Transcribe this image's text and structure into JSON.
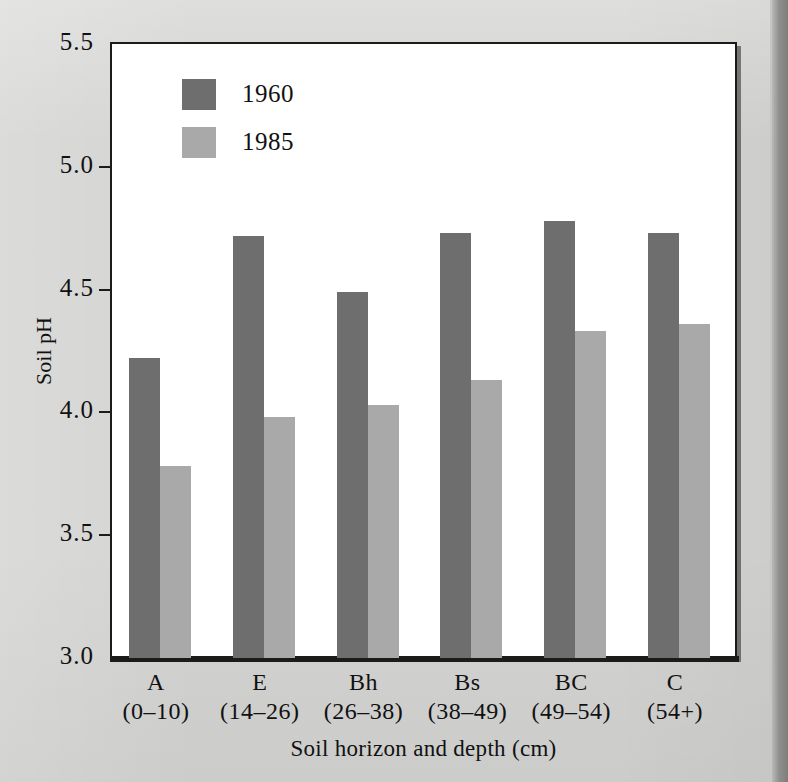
{
  "figure": {
    "background_color": "#d3d3d2",
    "plot_background_color": "#ffffff",
    "axis_color": "#1b1b1b"
  },
  "chart_data": {
    "type": "bar",
    "title": "",
    "xlabel": "Soil horizon and depth (cm)",
    "ylabel": "Soil pH",
    "ylim": [
      3.0,
      5.5
    ],
    "yticks": [
      "3.0",
      "3.5",
      "4.0",
      "4.5",
      "5.0",
      "5.5"
    ],
    "ytick_values": [
      3.0,
      3.5,
      4.0,
      4.5,
      5.0,
      5.5
    ],
    "grid": false,
    "legend_position": "upper-left-inside",
    "categories": [
      "A",
      "E",
      "Bh",
      "Bs",
      "BC",
      "C"
    ],
    "category_sublabels": [
      "(0–10)",
      "(14–26)",
      "(26–38)",
      "(38–49)",
      "(49–54)",
      "(54+)"
    ],
    "series": [
      {
        "name": "1960",
        "color": "#6e6e6e",
        "values": [
          4.22,
          4.72,
          4.49,
          4.73,
          4.78,
          4.73
        ]
      },
      {
        "name": "1985",
        "color": "#a9a9a9",
        "values": [
          3.78,
          3.98,
          4.03,
          4.13,
          4.33,
          4.36
        ]
      }
    ]
  }
}
